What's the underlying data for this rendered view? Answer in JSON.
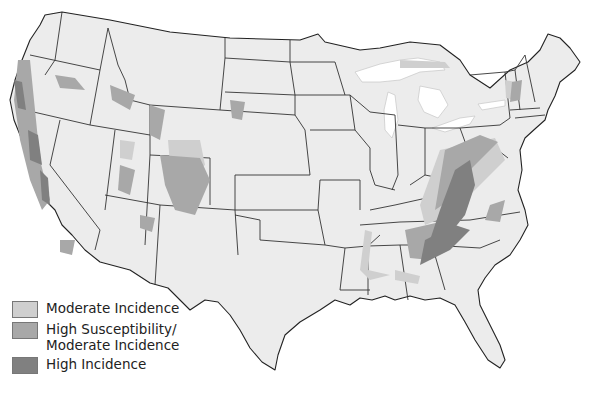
{
  "map": {
    "subject": "Contiguous United States incidence map",
    "colors": {
      "background": "#ffffff",
      "land": "#ececec",
      "state_borders": "#333333",
      "moderate_incidence": "#cfcfcf",
      "high_susceptibility_moderate_incidence": "#a8a8a8",
      "high_incidence": "#808080"
    }
  },
  "legend": {
    "items": [
      {
        "label": "Moderate Incidence",
        "color": "#cfcfcf"
      },
      {
        "label": "High Susceptibility/\nModerate Incidence",
        "color": "#a8a8a8"
      },
      {
        "label": "High Incidence",
        "color": "#808080"
      }
    ]
  }
}
